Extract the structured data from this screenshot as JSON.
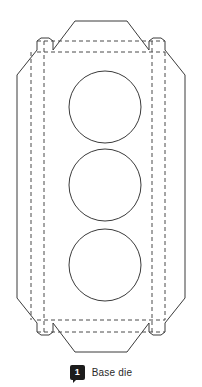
{
  "figure": {
    "type": "packaging-dieline",
    "canvas": {
      "width": 202,
      "height": 387
    },
    "colors": {
      "background": "#ffffff",
      "cut_line": "#3b3b3b",
      "fold_line": "#4a4a4a",
      "legend_marker": "#1c1c1c",
      "legend_text": "#2a2a2a"
    },
    "outline_cut_path": "M 75 21 L 127 21 L 149 50 L 149 41 L 153 38 L 161 38 L 165 41 L 165 50 L 185 75 L 185 298 L 165 323 L 165 332 L 161 335 L 153 335 L 149 332 L 149 323 L 127 352 L 75 352 L 53 323 L 53 332 L 49 335 L 41 335 L 37 332 L 37 323 L 17 298 L 17 75 L 37 50 L 37 41 L 41 38 L 49 38 L 53 41 L 53 50 Z",
    "fold_lines": [
      {
        "name": "top-outer-crease",
        "x1": 37,
        "y1": 41,
        "x2": 165,
        "y2": 41
      },
      {
        "name": "top-inner-crease",
        "x1": 37,
        "y1": 52,
        "x2": 165,
        "y2": 52
      },
      {
        "name": "bottom-inner-crease",
        "x1": 37,
        "y1": 320,
        "x2": 165,
        "y2": 320
      },
      {
        "name": "bottom-outer-crease",
        "x1": 37,
        "y1": 332,
        "x2": 165,
        "y2": 332
      },
      {
        "name": "left-outer-crease",
        "x1": 31,
        "y1": 52,
        "x2": 31,
        "y2": 320
      },
      {
        "name": "left-inner-crease",
        "x1": 44,
        "y1": 41,
        "x2": 44,
        "y2": 332
      },
      {
        "name": "right-inner-crease",
        "x1": 152,
        "y1": 41,
        "x2": 152,
        "y2": 332
      },
      {
        "name": "right-outer-crease",
        "x1": 165,
        "y1": 52,
        "x2": 165,
        "y2": 320
      }
    ],
    "die_cut_holes": [
      {
        "name": "hole-top",
        "cx": 105,
        "cy": 107,
        "r": 36
      },
      {
        "name": "hole-middle",
        "cx": 105,
        "cy": 185,
        "r": 36
      },
      {
        "name": "hole-bottom",
        "cx": 105,
        "cy": 265,
        "r": 36
      }
    ]
  },
  "legend": {
    "marker_number": "1",
    "label": "Base die"
  }
}
